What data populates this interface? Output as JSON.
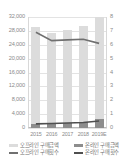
{
  "chart_data": {
    "type": "bar",
    "title": "",
    "subtitle": "",
    "xlabel": "",
    "ylabel": "",
    "categories": [
      "2015",
      "2016",
      "2017",
      "2018",
      "2019E"
    ],
    "grid": true,
    "legend_position": "bottom",
    "axes": {
      "left": {
        "label": "",
        "min": 0,
        "max": 32000,
        "step": 4000,
        "ticks": [
          "0",
          "4,000",
          "8,000",
          "12,000",
          "16,000",
          "20,000",
          "24,000",
          "28,000",
          "32,000"
        ]
      },
      "right": {
        "label": "",
        "min": 0,
        "max": 8,
        "step": 1,
        "ticks": [
          "0",
          "1",
          "2",
          "3",
          "4",
          "5",
          "6",
          "7",
          "8"
        ]
      }
    },
    "series": [
      {
        "name": "오프라인 구매금액",
        "type": "bar",
        "axis": "left",
        "color": "#dcdcdc",
        "values": [
          29200,
          27400,
          28400,
          29400,
          32000
        ]
      },
      {
        "name": "온라인 구매금액",
        "type": "bar",
        "axis": "left",
        "color": "#8d8d8d",
        "values": [
          1250,
          1350,
          1500,
          1700,
          2600
        ]
      },
      {
        "name": "오프라인 구매횟수",
        "type": "line",
        "axis": "right",
        "color": "#707070",
        "values": [
          6.9,
          6.3,
          6.35,
          6.4,
          6.1
        ]
      },
      {
        "name": "온라인 구매횟수",
        "type": "line",
        "axis": "right",
        "color": "#4f4f4f",
        "values": [
          0.3,
          0.32,
          0.36,
          0.4,
          0.5
        ]
      }
    ]
  },
  "legend": {
    "items": [
      {
        "label": "오프라인 구매금액",
        "marker": "bar",
        "color": "#dcdcdc"
      },
      {
        "label": "온라인 구매금액",
        "marker": "bar",
        "color": "#8d8d8d"
      },
      {
        "label": "오프라인 구매횟수",
        "marker": "line",
        "color": "#707070"
      },
      {
        "label": "온라인 구매횟수",
        "marker": "line",
        "color": "#4f4f4f"
      }
    ]
  }
}
